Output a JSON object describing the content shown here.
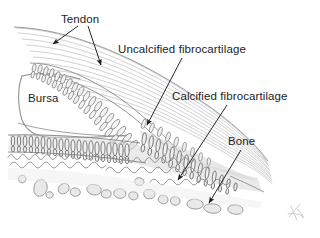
{
  "figure": {
    "kind": "anatomical-sketch",
    "medium": "pencil drawing",
    "background_color": "#ffffff",
    "width": 320,
    "height": 238
  },
  "labels": {
    "tendon": "Tendon",
    "uncalcified_fibrocartilage": "Uncalcified fibrocartilage",
    "calcified_fibrocartilage": "Calcified fibrocartilage",
    "bursa": "Bursa",
    "bone": "Bone"
  },
  "label_style": {
    "text_color": "#232323",
    "font_size_px": 11.5
  },
  "leader_lines": [
    {
      "name": "tendon-arrow-left",
      "from_label": "Tendon",
      "x1": 78,
      "y1": 26,
      "x2": 52,
      "y2": 45,
      "arrowhead": "end"
    },
    {
      "name": "tendon-arrow-right",
      "from_label": "Tendon",
      "x1": 88,
      "y1": 26,
      "x2": 101,
      "y2": 66,
      "arrowhead": "end"
    },
    {
      "name": "uncalcified-arrow",
      "from_label": "Uncalcified fibrocartilage",
      "x1": 182,
      "y1": 58,
      "x2": 146,
      "y2": 126,
      "arrowhead": "end"
    },
    {
      "name": "calcified-arrow",
      "from_label": "Calcified fibrocartilage",
      "x1": 227,
      "y1": 105,
      "x2": 177,
      "y2": 181,
      "arrowhead": "end"
    },
    {
      "name": "bone-arrow",
      "from_label": "Bone",
      "x1": 241,
      "y1": 150,
      "x2": 208,
      "y2": 204,
      "arrowhead": "end"
    }
  ],
  "regions": [
    {
      "name": "tendon-fibres",
      "label": "Tendon",
      "description": "pale grey parallel collagen fibre bundles sweeping from upper-left to lower-right",
      "stroke_color": "#b9b9b9"
    },
    {
      "name": "bursa-cavity",
      "label": "Bursa",
      "description": "outlined wedge-shaped cavity on the left beneath the tendon",
      "stroke_color": "#8d8d8d"
    },
    {
      "name": "uncalcified-fibrocartilage-zone",
      "label": "Uncalcified fibrocartilage",
      "description": "band of elongated chondrocyte columns above the tidemark",
      "stroke_color": "#6f6f6f"
    },
    {
      "name": "calcified-fibrocartilage-zone",
      "label": "Calcified fibrocartilage",
      "description": "grey shaded band of chondrocyte columns below the tidemark",
      "stroke_color": "#7a7a7a",
      "fill_color": "#d7d7d7"
    },
    {
      "name": "tidemark",
      "description": "wavy scalloped line separating calcified from uncalcified fibrocartilage",
      "stroke_color": "#8a8a8a"
    },
    {
      "name": "bone-trabeculae",
      "label": "Bone",
      "description": "irregular outlined trabecular fragments at the bottom",
      "stroke_color": "#8a8a8a",
      "fill_color": "#e6e6e6"
    }
  ],
  "artist_mark": {
    "name": "signature",
    "description": "faint pencil initials in the lower-right corner",
    "x": 295,
    "y": 212
  }
}
